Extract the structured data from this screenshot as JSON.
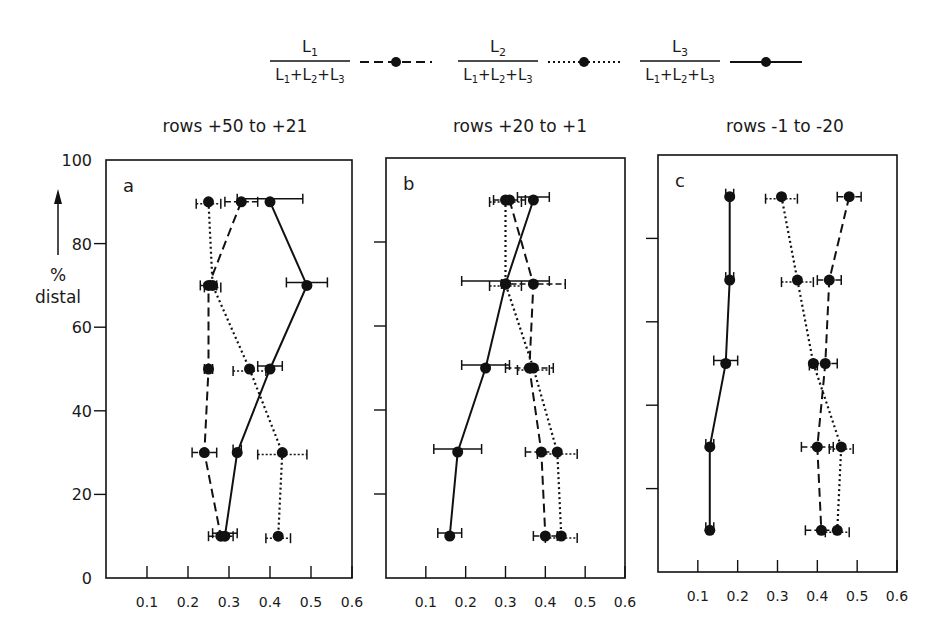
{
  "legend": [
    {
      "numerator": "L1",
      "denominator": "L1+L2+L3",
      "style": "dashed",
      "label": "L1/(L1+L2+L3)"
    },
    {
      "numerator": "L2",
      "denominator": "L1+L2+L3",
      "style": "dotted",
      "label": "L2/(L1+L2+L3)"
    },
    {
      "numerator": "L3",
      "denominator": "L1+L2+L3",
      "style": "solid",
      "label": "L3/(L1+L2+L3)"
    }
  ],
  "ylabel_percent": "%",
  "ylabel_word": "distal",
  "chart_data": [
    {
      "type": "line",
      "panel": "a",
      "title": "rows +50 to +21",
      "xlabel": "",
      "ylabel": "% distal",
      "xlim": [
        0,
        0.6
      ],
      "ylim": [
        0,
        100
      ],
      "xticks": [
        "0.1",
        "0.2",
        "0.3",
        "0.4",
        "0.5",
        "0.6"
      ],
      "yticks": [
        "0",
        "20",
        "40",
        "60",
        "80",
        "100"
      ],
      "y": [
        90,
        70,
        50,
        30,
        10
      ],
      "series": [
        {
          "name": "L1/(L1+L2+L3)",
          "style": "dashed",
          "values": [
            0.33,
            0.25,
            0.25,
            0.24,
            0.28
          ],
          "err": [
            0.04,
            0.02,
            0.01,
            0.03,
            0.03
          ]
        },
        {
          "name": "L2/(L1+L2+L3)",
          "style": "dotted",
          "values": [
            0.25,
            0.26,
            0.35,
            0.43,
            0.42
          ],
          "err": [
            0.03,
            0.02,
            0.04,
            0.06,
            0.03
          ]
        },
        {
          "name": "L3/(L1+L2+L3)",
          "style": "solid",
          "values": [
            0.4,
            0.49,
            0.4,
            0.32,
            0.29
          ],
          "err": [
            0.08,
            0.05,
            0.03,
            0.01,
            0.03
          ]
        }
      ]
    },
    {
      "type": "line",
      "panel": "b",
      "title": "rows +20 to +1",
      "xlim": [
        0,
        0.6
      ],
      "ylim": [
        0,
        100
      ],
      "xticks": [
        "0.1",
        "0.2",
        "0.3",
        "0.4",
        "0.5",
        "0.6"
      ],
      "y": [
        90,
        70,
        50,
        30,
        10
      ],
      "series": [
        {
          "name": "L1/(L1+L2+L3)",
          "style": "dashed",
          "values": [
            0.31,
            0.37,
            0.36,
            0.39,
            0.4
          ],
          "err": [
            0.04,
            0.08,
            0.06,
            0.04,
            0.03
          ]
        },
        {
          "name": "L2/(L1+L2+L3)",
          "style": "dotted",
          "values": [
            0.3,
            0.3,
            0.37,
            0.43,
            0.44
          ],
          "err": [
            0.04,
            0.04,
            0.04,
            0.05,
            0.04
          ]
        },
        {
          "name": "L3/(L1+L2+L3)",
          "style": "solid",
          "values": [
            0.37,
            0.3,
            0.25,
            0.18,
            0.16
          ],
          "err": [
            0.04,
            0.11,
            0.06,
            0.06,
            0.03
          ]
        }
      ]
    },
    {
      "type": "line",
      "panel": "c",
      "title": "rows -1 to -20",
      "xlim": [
        0,
        0.6
      ],
      "ylim": [
        0,
        100
      ],
      "xticks": [
        "0.1",
        "0.2",
        "0.3",
        "0.4",
        "0.5",
        "0.6"
      ],
      "y": [
        90,
        70,
        50,
        30,
        10
      ],
      "series": [
        {
          "name": "L1/(L1+L2+L3)",
          "style": "dashed",
          "values": [
            0.48,
            0.43,
            0.42,
            0.4,
            0.41
          ],
          "err": [
            0.03,
            0.03,
            0.03,
            0.04,
            0.04
          ]
        },
        {
          "name": "L2/(L1+L2+L3)",
          "style": "dotted",
          "values": [
            0.31,
            0.35,
            0.39,
            0.46,
            0.45
          ],
          "err": [
            0.04,
            0.04,
            0.01,
            0.03,
            0.03
          ]
        },
        {
          "name": "L3/(L1+L2+L3)",
          "style": "solid",
          "values": [
            0.18,
            0.18,
            0.17,
            0.13,
            0.13
          ],
          "err": [
            0.01,
            0.01,
            0.03,
            0.01,
            0.01
          ]
        }
      ]
    }
  ]
}
